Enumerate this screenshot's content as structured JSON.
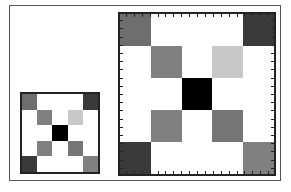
{
  "diagram": {
    "grid_size": 5,
    "colors": {
      "W": "#ffffff",
      "K": "#000000",
      "D": "#3a3a3a",
      "M": "#6e6e6e",
      "G": "#808080",
      "L": "#c8c8c8",
      "N": "#757575"
    },
    "cells": [
      [
        "M",
        "W",
        "W",
        "W",
        "D"
      ],
      [
        "W",
        "G",
        "W",
        "L",
        "W"
      ],
      [
        "W",
        "W",
        "K",
        "W",
        "W"
      ],
      [
        "W",
        "G",
        "W",
        "N",
        "W"
      ],
      [
        "D",
        "W",
        "W",
        "W",
        "G"
      ]
    ],
    "tick_count_per_side": 20
  }
}
